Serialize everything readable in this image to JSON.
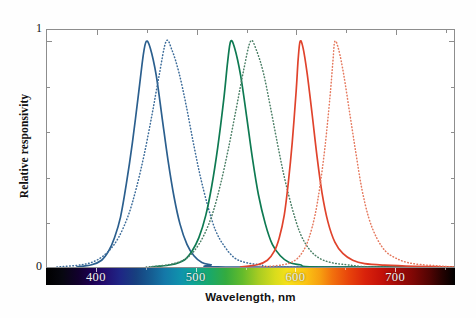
{
  "chart_data": {
    "type": "line",
    "title": "",
    "xlabel": "Wavelength, nm",
    "ylabel": "Relative responsivity",
    "xlim": [
      350,
      760
    ],
    "ylim": [
      0,
      1.05
    ],
    "grid": false,
    "legend": null,
    "x_ticks": [
      400,
      500,
      600,
      700
    ],
    "x_tick_labels": [
      "400",
      "500",
      "600",
      "700"
    ],
    "x_minor_ticks": [
      450,
      550,
      650,
      750
    ],
    "y_ticks": [
      0,
      1
    ],
    "y_tick_labels": [
      "0",
      "1"
    ],
    "y_minor_ticks": [
      0.2,
      0.4,
      0.6,
      0.8
    ],
    "colorbar": {
      "name": "visible-spectrum-bar",
      "from_nm": 350,
      "to_nm": 760,
      "stops": [
        {
          "nm": 350,
          "color": "#000000"
        },
        {
          "nm": 380,
          "color": "#12002e"
        },
        {
          "nm": 400,
          "color": "#230b6e"
        },
        {
          "nm": 425,
          "color": "#1f2585"
        },
        {
          "nm": 450,
          "color": "#155f94"
        },
        {
          "nm": 480,
          "color": "#0f93ad"
        },
        {
          "nm": 500,
          "color": "#0fa596"
        },
        {
          "nm": 520,
          "color": "#19a86a"
        },
        {
          "nm": 540,
          "color": "#34ab3f"
        },
        {
          "nm": 560,
          "color": "#a8cc22"
        },
        {
          "nm": 580,
          "color": "#f6e01a"
        },
        {
          "nm": 600,
          "color": "#fbc814"
        },
        {
          "nm": 620,
          "color": "#f2710d"
        },
        {
          "nm": 640,
          "color": "#e8440b"
        },
        {
          "nm": 660,
          "color": "#c41109"
        },
        {
          "nm": 690,
          "color": "#7c0705"
        },
        {
          "nm": 720,
          "color": "#4e0403"
        },
        {
          "nm": 760,
          "color": "#000000"
        }
      ]
    },
    "series": [
      {
        "name": "blue-solid",
        "style": "solid",
        "color": "#2b5f8e",
        "peak_nm": 450,
        "peak_value": 1.0,
        "width_left_nm": 26,
        "width_right_nm": 28,
        "points": [
          {
            "x": 380,
            "y": 0.0
          },
          {
            "x": 395,
            "y": 0.01
          },
          {
            "x": 405,
            "y": 0.03
          },
          {
            "x": 412,
            "y": 0.07
          },
          {
            "x": 418,
            "y": 0.13
          },
          {
            "x": 424,
            "y": 0.22
          },
          {
            "x": 430,
            "y": 0.37
          },
          {
            "x": 436,
            "y": 0.55
          },
          {
            "x": 442,
            "y": 0.76
          },
          {
            "x": 447,
            "y": 0.94
          },
          {
            "x": 450,
            "y": 1.0
          },
          {
            "x": 454,
            "y": 0.97
          },
          {
            "x": 460,
            "y": 0.85
          },
          {
            "x": 466,
            "y": 0.66
          },
          {
            "x": 472,
            "y": 0.47
          },
          {
            "x": 478,
            "y": 0.31
          },
          {
            "x": 484,
            "y": 0.19
          },
          {
            "x": 491,
            "y": 0.1
          },
          {
            "x": 498,
            "y": 0.05
          },
          {
            "x": 506,
            "y": 0.02
          },
          {
            "x": 515,
            "y": 0.01
          },
          {
            "x": 530,
            "y": 0.0
          },
          {
            "x": 760,
            "y": 0.0
          }
        ]
      },
      {
        "name": "blue-dotted",
        "style": "dotted",
        "color": "#3b6b99",
        "peak_nm": 470,
        "peak_value": 1.0,
        "width_left_nm": 30,
        "width_right_nm": 34,
        "points": [
          {
            "x": 360,
            "y": 0.0
          },
          {
            "x": 385,
            "y": 0.01
          },
          {
            "x": 400,
            "y": 0.03
          },
          {
            "x": 412,
            "y": 0.07
          },
          {
            "x": 422,
            "y": 0.13
          },
          {
            "x": 432,
            "y": 0.23
          },
          {
            "x": 440,
            "y": 0.35
          },
          {
            "x": 448,
            "y": 0.5
          },
          {
            "x": 456,
            "y": 0.68
          },
          {
            "x": 463,
            "y": 0.85
          },
          {
            "x": 470,
            "y": 1.0
          },
          {
            "x": 476,
            "y": 0.96
          },
          {
            "x": 483,
            "y": 0.86
          },
          {
            "x": 490,
            "y": 0.72
          },
          {
            "x": 497,
            "y": 0.56
          },
          {
            "x": 504,
            "y": 0.41
          },
          {
            "x": 512,
            "y": 0.27
          },
          {
            "x": 520,
            "y": 0.16
          },
          {
            "x": 529,
            "y": 0.09
          },
          {
            "x": 539,
            "y": 0.04
          },
          {
            "x": 550,
            "y": 0.02
          },
          {
            "x": 565,
            "y": 0.01
          },
          {
            "x": 590,
            "y": 0.0
          },
          {
            "x": 760,
            "y": 0.0
          }
        ]
      },
      {
        "name": "green-solid",
        "style": "solid",
        "color": "#0e7a52",
        "peak_nm": 535,
        "peak_value": 1.0,
        "width_left_nm": 24,
        "width_right_nm": 26,
        "points": [
          {
            "x": 455,
            "y": 0.0
          },
          {
            "x": 475,
            "y": 0.01
          },
          {
            "x": 488,
            "y": 0.03
          },
          {
            "x": 496,
            "y": 0.07
          },
          {
            "x": 503,
            "y": 0.13
          },
          {
            "x": 510,
            "y": 0.23
          },
          {
            "x": 516,
            "y": 0.36
          },
          {
            "x": 522,
            "y": 0.53
          },
          {
            "x": 528,
            "y": 0.74
          },
          {
            "x": 532,
            "y": 0.91
          },
          {
            "x": 535,
            "y": 1.0
          },
          {
            "x": 539,
            "y": 0.97
          },
          {
            "x": 545,
            "y": 0.85
          },
          {
            "x": 551,
            "y": 0.67
          },
          {
            "x": 557,
            "y": 0.48
          },
          {
            "x": 563,
            "y": 0.32
          },
          {
            "x": 570,
            "y": 0.19
          },
          {
            "x": 577,
            "y": 0.1
          },
          {
            "x": 585,
            "y": 0.05
          },
          {
            "x": 594,
            "y": 0.02
          },
          {
            "x": 605,
            "y": 0.01
          },
          {
            "x": 625,
            "y": 0.0
          },
          {
            "x": 760,
            "y": 0.0
          }
        ]
      },
      {
        "name": "green-dotted",
        "style": "dotted",
        "color": "#4b7f66",
        "peak_nm": 555,
        "peak_value": 1.0,
        "width_left_nm": 28,
        "width_right_nm": 32,
        "points": [
          {
            "x": 450,
            "y": 0.0
          },
          {
            "x": 472,
            "y": 0.01
          },
          {
            "x": 487,
            "y": 0.03
          },
          {
            "x": 498,
            "y": 0.07
          },
          {
            "x": 508,
            "y": 0.14
          },
          {
            "x": 517,
            "y": 0.24
          },
          {
            "x": 525,
            "y": 0.37
          },
          {
            "x": 533,
            "y": 0.53
          },
          {
            "x": 541,
            "y": 0.71
          },
          {
            "x": 548,
            "y": 0.87
          },
          {
            "x": 555,
            "y": 1.0
          },
          {
            "x": 561,
            "y": 0.96
          },
          {
            "x": 568,
            "y": 0.86
          },
          {
            "x": 575,
            "y": 0.71
          },
          {
            "x": 582,
            "y": 0.55
          },
          {
            "x": 589,
            "y": 0.4
          },
          {
            "x": 597,
            "y": 0.26
          },
          {
            "x": 605,
            "y": 0.15
          },
          {
            "x": 614,
            "y": 0.08
          },
          {
            "x": 624,
            "y": 0.04
          },
          {
            "x": 636,
            "y": 0.02
          },
          {
            "x": 652,
            "y": 0.01
          },
          {
            "x": 680,
            "y": 0.0
          },
          {
            "x": 760,
            "y": 0.0
          }
        ]
      },
      {
        "name": "red-solid",
        "style": "solid",
        "color": "#e0432c",
        "peak_nm": 605,
        "peak_value": 1.0,
        "width_left_nm": 17,
        "width_right_nm": 22,
        "points": [
          {
            "x": 545,
            "y": 0.0
          },
          {
            "x": 562,
            "y": 0.01
          },
          {
            "x": 572,
            "y": 0.03
          },
          {
            "x": 579,
            "y": 0.07
          },
          {
            "x": 584,
            "y": 0.13
          },
          {
            "x": 589,
            "y": 0.23
          },
          {
            "x": 593,
            "y": 0.37
          },
          {
            "x": 597,
            "y": 0.55
          },
          {
            "x": 601,
            "y": 0.78
          },
          {
            "x": 603,
            "y": 0.92
          },
          {
            "x": 605,
            "y": 1.0
          },
          {
            "x": 608,
            "y": 0.97
          },
          {
            "x": 612,
            "y": 0.86
          },
          {
            "x": 617,
            "y": 0.68
          },
          {
            "x": 622,
            "y": 0.49
          },
          {
            "x": 627,
            "y": 0.33
          },
          {
            "x": 633,
            "y": 0.2
          },
          {
            "x": 640,
            "y": 0.11
          },
          {
            "x": 648,
            "y": 0.06
          },
          {
            "x": 658,
            "y": 0.03
          },
          {
            "x": 670,
            "y": 0.015
          },
          {
            "x": 690,
            "y": 0.008
          },
          {
            "x": 720,
            "y": 0.003
          },
          {
            "x": 760,
            "y": 0.0
          }
        ]
      },
      {
        "name": "red-dotted",
        "style": "dotted",
        "color": "#e5795e",
        "peak_nm": 640,
        "peak_value": 1.0,
        "width_left_nm": 20,
        "width_right_nm": 28,
        "points": [
          {
            "x": 565,
            "y": 0.0
          },
          {
            "x": 588,
            "y": 0.01
          },
          {
            "x": 600,
            "y": 0.03
          },
          {
            "x": 608,
            "y": 0.07
          },
          {
            "x": 614,
            "y": 0.13
          },
          {
            "x": 620,
            "y": 0.23
          },
          {
            "x": 625,
            "y": 0.36
          },
          {
            "x": 630,
            "y": 0.53
          },
          {
            "x": 635,
            "y": 0.75
          },
          {
            "x": 638,
            "y": 0.91
          },
          {
            "x": 640,
            "y": 1.0
          },
          {
            "x": 644,
            "y": 0.96
          },
          {
            "x": 649,
            "y": 0.85
          },
          {
            "x": 655,
            "y": 0.68
          },
          {
            "x": 661,
            "y": 0.51
          },
          {
            "x": 667,
            "y": 0.35
          },
          {
            "x": 674,
            "y": 0.22
          },
          {
            "x": 682,
            "y": 0.13
          },
          {
            "x": 691,
            "y": 0.07
          },
          {
            "x": 701,
            "y": 0.04
          },
          {
            "x": 713,
            "y": 0.02
          },
          {
            "x": 728,
            "y": 0.01
          },
          {
            "x": 745,
            "y": 0.005
          },
          {
            "x": 760,
            "y": 0.0
          }
        ]
      }
    ]
  }
}
